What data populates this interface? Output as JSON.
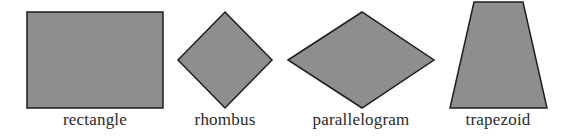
{
  "colors": {
    "fill": "#8e8e8e",
    "stroke": "#1e1e1e",
    "background": "#ffffff"
  },
  "shapes": [
    {
      "name": "rectangle",
      "label": "rectangle",
      "points": "27,12 163,12 163,108 27,108",
      "label_x": 95
    },
    {
      "name": "rhombus",
      "label": "rhombus",
      "points": "225,12 272,60 225,108 178,60",
      "label_x": 225
    },
    {
      "name": "parallelogram",
      "label": "parallelogram",
      "points": "288,60 362,12 434,60 362,108",
      "label_x": 361
    },
    {
      "name": "trapezoid",
      "label": "trapezoid",
      "points": "474,2 523,2 547,108 450,108",
      "label_x": 498
    }
  ]
}
